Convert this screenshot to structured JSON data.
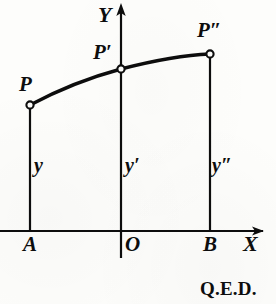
{
  "figure": {
    "background_color": "#fdfdfb",
    "ink_color": "#0d0d0d",
    "axes": {
      "x_axis_label": "X",
      "y_axis_label": "Y",
      "origin_label": "O",
      "x_axis_y_px": 231,
      "y_axis_x_px": 121,
      "x_axis_start_px": 0,
      "x_axis_end_px": 265,
      "y_axis_top_px": 3,
      "y_axis_bottom_px": 258,
      "arrowheads": [
        "x-axis-right",
        "y-axis-up"
      ]
    },
    "base_points": [
      {
        "name": "A",
        "label": "A",
        "x_px": 30
      },
      {
        "name": "O",
        "label": "O",
        "x_px": 121
      },
      {
        "name": "B",
        "label": "B",
        "x_px": 210
      }
    ],
    "curve_points": [
      {
        "name": "P",
        "label": "P",
        "x_px": 30,
        "y_px": 105
      },
      {
        "name": "P1",
        "label": "P′",
        "x_px": 121,
        "y_px": 69
      },
      {
        "name": "P2",
        "label": "P″",
        "x_px": 210,
        "y_px": 54
      }
    ],
    "ordinates": [
      {
        "name": "y",
        "label": "y",
        "from_x_px": 30,
        "top_y_px": 105,
        "bottom_y_px": 231,
        "label_x_px": 33,
        "label_y_px": 156
      },
      {
        "name": "y1",
        "label": "y′",
        "from_x_px": 121,
        "top_y_px": 69,
        "bottom_y_px": 231,
        "label_x_px": 124,
        "label_y_px": 156
      },
      {
        "name": "y2",
        "label": "y″",
        "from_x_px": 210,
        "top_y_px": 54,
        "bottom_y_px": 231,
        "label_x_px": 212,
        "label_y_px": 156
      }
    ],
    "curve": {
      "description": "concave-down arc through P, P', P''",
      "path": "M 30 105 C 60 89, 95 76, 121 69 C 152 61, 185 55, 210 54"
    },
    "footer_text": "Q.E.D."
  }
}
